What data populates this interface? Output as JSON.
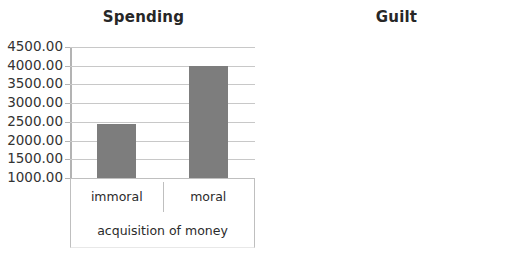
{
  "chart_data": [
    {
      "type": "bar",
      "title": "Spending",
      "xlabel": "acquisition of money",
      "ylabel": "",
      "categories": [
        "immoral",
        "moral"
      ],
      "values": [
        2450,
        4000
      ],
      "ylim": [
        1000,
        4500
      ],
      "yticks": [
        4500,
        4000,
        3500,
        3000,
        2500,
        2000,
        1500,
        1000
      ],
      "ytick_labels": [
        "4500.00",
        "4000.00",
        "3500.00",
        "3000.00",
        "2500.00",
        "2000.00",
        "1500.00",
        "1000.00"
      ],
      "grid": true,
      "legend": false,
      "bar_color": "#7d7d7d"
    },
    {
      "type": "bar",
      "title": "Guilt",
      "xlabel": "acquisition of money",
      "ylabel": "",
      "categories": [
        "immoral",
        "moral"
      ],
      "values": [
        5.55,
        2.78
      ],
      "ylim": [
        1.0,
        6.0
      ],
      "yticks": [
        6.0,
        5.0,
        4.0,
        3.0,
        2.0,
        1.0
      ],
      "ytick_labels": [
        "6.00",
        "5.00",
        "4.00",
        "3.00",
        "2.00",
        "1.00"
      ],
      "grid": true,
      "legend": false,
      "bar_color": "#7d7d7d"
    }
  ],
  "colors": {
    "background": "#ffffff",
    "bar": "#7d7d7d",
    "gridline": "#c8c8c8",
    "axis": "#b3b3b3",
    "border": "#bfbfbf",
    "text": "#2b2b2b",
    "title": "#272727"
  }
}
